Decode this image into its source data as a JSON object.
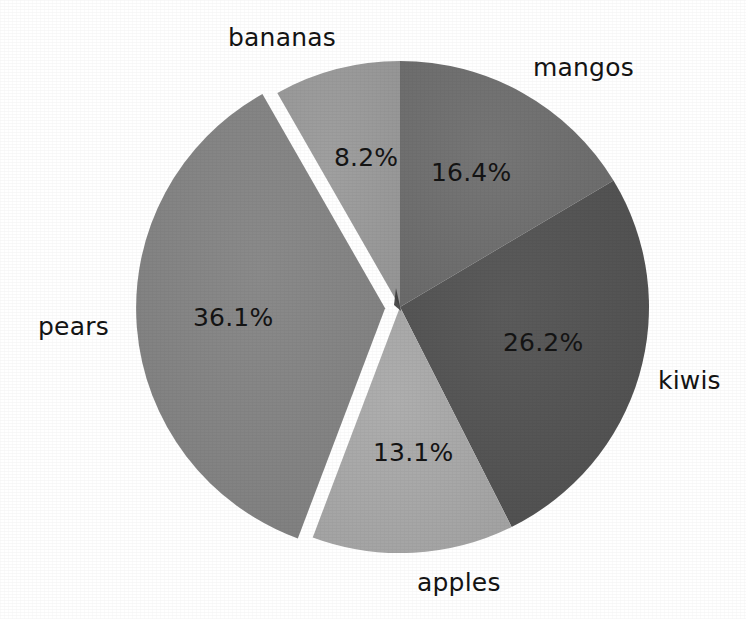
{
  "chart_data": {
    "type": "pie",
    "title": "",
    "categories": [
      "mangos",
      "kiwis",
      "apples",
      "pears",
      "bananas"
    ],
    "values": [
      16.4,
      26.2,
      13.1,
      36.1,
      8.2
    ],
    "value_labels": [
      "16.4%",
      "26.2%",
      "13.1%",
      "36.1%",
      "8.2%"
    ],
    "unit": "%",
    "autopct_format": "%.1f%%",
    "start_angle_deg": 90,
    "direction": "clockwise",
    "exploded_slices": [
      "pears"
    ],
    "explode_offsets": [
      0,
      0,
      0,
      0.06,
      0
    ],
    "legend": "none",
    "grid": false,
    "shadow": false,
    "slice_colors": [
      "#6e6e6e",
      "#545454",
      "#a8a8a8",
      "#848484",
      "#9a9a9a"
    ],
    "background_color": "#ffffff",
    "text_color": "#141414",
    "slices": [
      {
        "label": "mangos",
        "value": 16.4,
        "value_label": "16.4%",
        "color": "#6e6e6e",
        "exploded": false
      },
      {
        "label": "kiwis",
        "value": 26.2,
        "value_label": "26.2%",
        "color": "#545454",
        "exploded": false
      },
      {
        "label": "apples",
        "value": 13.1,
        "value_label": "13.1%",
        "color": "#a8a8a8",
        "exploded": false
      },
      {
        "label": "pears",
        "value": 36.1,
        "value_label": "36.1%",
        "color": "#848484",
        "exploded": true
      },
      {
        "label": "bananas",
        "value": 8.2,
        "value_label": "8.2%",
        "color": "#9a9a9a",
        "exploded": false
      }
    ]
  },
  "labels": {
    "bananas": "bananas",
    "mangos": "mangos",
    "kiwis": "kiwis",
    "apples": "apples",
    "pears": "pears"
  },
  "percents": {
    "bananas": "8.2%",
    "mangos": "16.4%",
    "kiwis": "26.2%",
    "apples": "13.1%",
    "pears": "36.1%"
  }
}
